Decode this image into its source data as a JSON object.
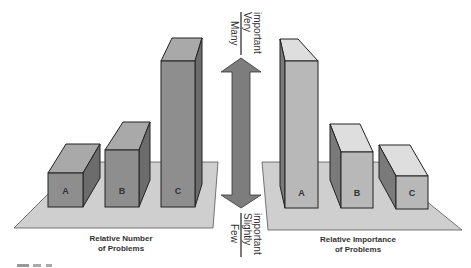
{
  "figure": {
    "left_panel": {
      "caption_line1": "Relative Number",
      "caption_line2": "of Problems",
      "bars": [
        {
          "label": "A",
          "relative_height": 1
        },
        {
          "label": "B",
          "relative_height": 1.7
        },
        {
          "label": "C",
          "relative_height": 4.3
        }
      ]
    },
    "right_panel": {
      "caption_line1": "Relative Importance",
      "caption_line2": "of Problems",
      "bars": [
        {
          "label": "A",
          "relative_height": 4.4
        },
        {
          "label": "B",
          "relative_height": 1.7
        },
        {
          "label": "C",
          "relative_height": 1
        }
      ]
    },
    "scale_arrow": {
      "top_left_label": "Many",
      "top_right_label_line1": "Very",
      "top_right_label_line2": "important",
      "bottom_left_label": "Few",
      "bottom_right_label_line1": "Slightly",
      "bottom_right_label_line2": "important"
    },
    "colors": {
      "platform": "#cfcfcf",
      "bar_front_left": "#8f8f8f",
      "bar_top_left": "#b0b0b0",
      "bar_side_left": "#6e6e6e",
      "bar_front_right": "#b8b8b8",
      "bar_top_right": "#dedede",
      "bar_side_right": "#7a7a7a",
      "arrow": "#7d7d7d",
      "outline": "#222222"
    }
  }
}
